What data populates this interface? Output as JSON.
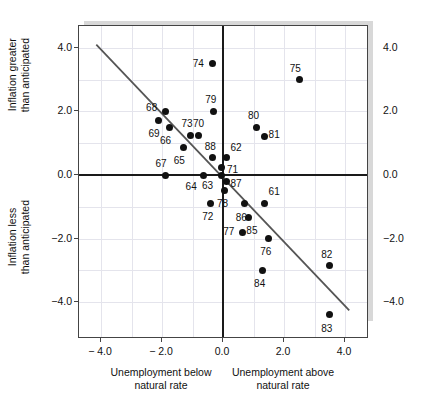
{
  "chart_data": {
    "type": "scatter",
    "title": "",
    "xlabel_left": "Unemployment below\nnatural rate",
    "xlabel_right": "Unemployment above\nnatural rate",
    "ylabel_upper": "Inflation greater\nthan anticipated",
    "ylabel_lower": "Inflation less\nthan anticipated",
    "xlim": [
      -4.85,
      4.7
    ],
    "ylim": [
      -5.0,
      4.9
    ],
    "xticks": [
      -4.0,
      -2.0,
      0.0,
      2.0,
      4.0
    ],
    "xticklabels": [
      "− 4.0",
      "− 2.0",
      "0.0",
      "2.0",
      "4.0"
    ],
    "yticks": [
      4.0,
      2.0,
      0.0,
      -2.0,
      -4.0
    ],
    "yticklabels": [
      "4.0",
      "2.0",
      "0.0",
      "−2.0",
      "−4.0"
    ],
    "yticklabels_right": [
      "4.0",
      "2.0",
      "0.0",
      "−2.0",
      "−4.0"
    ],
    "minor_xticks": [
      -3.0,
      -1.0,
      1.0,
      3.0
    ],
    "minor_yticks": [
      3.0,
      1.0,
      -1.0,
      -3.0
    ],
    "grid": true,
    "legend": "none",
    "zero_axes": true,
    "trendline": {
      "label": "fitted-trend-line",
      "x0": -4.15,
      "y0": 4.1,
      "x1": 4.2,
      "y1": -4.32,
      "color": "#555555"
    },
    "point_color": "#111111",
    "points": [
      {
        "label": "61",
        "x": 1.35,
        "y": -0.9,
        "lx": 10,
        "ly": -12
      },
      {
        "label": "62",
        "x": 0.1,
        "y": 0.55,
        "lx": 10,
        "ly": -10
      },
      {
        "label": "63",
        "x": -0.05,
        "y": 0.0,
        "lx": -14,
        "ly": 11
      },
      {
        "label": "64",
        "x": -0.65,
        "y": 0.0,
        "lx": -12,
        "ly": 12
      },
      {
        "label": "65",
        "x": -1.3,
        "y": 0.85,
        "lx": -4,
        "ly": 13
      },
      {
        "label": "66",
        "x": -1.75,
        "y": 1.5,
        "lx": -4,
        "ly": 14
      },
      {
        "label": "67",
        "x": -1.9,
        "y": 0.0,
        "lx": -4,
        "ly": -11
      },
      {
        "label": "68",
        "x": -1.88,
        "y": 2.0,
        "lx": -14,
        "ly": -3
      },
      {
        "label": "69",
        "x": -2.1,
        "y": 1.7,
        "lx": -5,
        "ly": 13
      },
      {
        "label": "70",
        "x": -0.8,
        "y": 1.25,
        "lx": 0,
        "ly": -11
      },
      {
        "label": "71",
        "x": -0.05,
        "y": 0.25,
        "lx": 11,
        "ly": 3
      },
      {
        "label": "72",
        "x": -0.4,
        "y": -0.9,
        "lx": -3,
        "ly": 13
      },
      {
        "label": "73",
        "x": -1.05,
        "y": 1.25,
        "lx": -4,
        "ly": -11
      },
      {
        "label": "74",
        "x": -0.35,
        "y": 3.5,
        "lx": -14,
        "ly": 0
      },
      {
        "label": "75",
        "x": 2.5,
        "y": 3.0,
        "lx": -4,
        "ly": -11
      },
      {
        "label": "76",
        "x": 1.5,
        "y": -2.0,
        "lx": -3,
        "ly": 13
      },
      {
        "label": "77",
        "x": 0.65,
        "y": -1.8,
        "lx": -14,
        "ly": 0
      },
      {
        "label": "78",
        "x": 0.05,
        "y": -0.5,
        "lx": -2,
        "ly": 13
      },
      {
        "label": "79",
        "x": -0.3,
        "y": 2.0,
        "lx": -3,
        "ly": -11
      },
      {
        "label": "80",
        "x": 1.1,
        "y": 1.5,
        "lx": -3,
        "ly": -11
      },
      {
        "label": "81",
        "x": 1.35,
        "y": 1.2,
        "lx": 10,
        "ly": -2
      },
      {
        "label": "82",
        "x": 3.5,
        "y": -2.85,
        "lx": -3,
        "ly": -11
      },
      {
        "label": "83",
        "x": 3.5,
        "y": -4.4,
        "lx": -3,
        "ly": 14
      },
      {
        "label": "84",
        "x": 1.3,
        "y": -3.0,
        "lx": -3,
        "ly": 14
      },
      {
        "label": "85",
        "x": 0.85,
        "y": -1.35,
        "lx": 3,
        "ly": 13
      },
      {
        "label": "86",
        "x": 0.7,
        "y": -0.9,
        "lx": -3,
        "ly": 14
      },
      {
        "label": "87",
        "x": 0.1,
        "y": -0.2,
        "lx": 10,
        "ly": 3
      },
      {
        "label": "88",
        "x": -0.35,
        "y": 0.55,
        "lx": -2,
        "ly": -11
      }
    ]
  }
}
